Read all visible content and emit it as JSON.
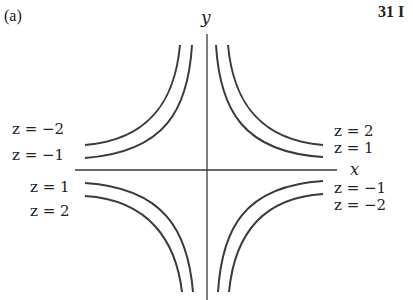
{
  "figure": {
    "panel_label": "(a)",
    "page_number_fragment": "31  I",
    "axes": {
      "x_label": "x",
      "y_label": "y"
    },
    "level_curves": {
      "equation_hint": "z = xy style hyperbolic contours",
      "left_labels": [
        "z = −2",
        "z = −1",
        "z = 1",
        "z = 2"
      ],
      "right_labels": [
        "z = 2",
        "z = 1",
        "z = −1",
        "z = −2"
      ],
      "values": [
        -2,
        -1,
        1,
        2
      ]
    },
    "colors": {
      "curve": "#3a3a3a",
      "axis": "#3a3a3a",
      "text": "#222222",
      "background": "#ffffff"
    }
  }
}
